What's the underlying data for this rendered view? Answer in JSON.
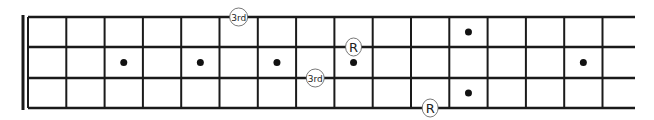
{
  "diagram": {
    "type": "bass-fretboard",
    "strings": 4,
    "frets_visible": 15,
    "colors": {
      "line": "#1a1a1a",
      "background": "#ffffff",
      "dot": "#111111",
      "marker_stroke": "#555555"
    },
    "geometry": {
      "nut_x": 28,
      "nut_thick_x": 23,
      "fret_spacing": 38.3,
      "string_end_x": 635,
      "string_y": [
        17,
        47,
        78,
        108
      ]
    },
    "inlay_dots": [
      {
        "fret": 3,
        "position": "center"
      },
      {
        "fret": 5,
        "position": "center"
      },
      {
        "fret": 7,
        "position": "center"
      },
      {
        "fret": 9,
        "position": "center"
      },
      {
        "fret": 12,
        "position": "upper"
      },
      {
        "fret": 12,
        "position": "lower"
      },
      {
        "fret": 15,
        "position": "center"
      }
    ],
    "note_markers": [
      {
        "label": "3rd",
        "string": 1,
        "fret": 6
      },
      {
        "label": "R",
        "string": 2,
        "fret": 9
      },
      {
        "label": "3rd",
        "string": 3,
        "fret": 8
      },
      {
        "label": "R",
        "string": 4,
        "fret": 11
      }
    ]
  }
}
